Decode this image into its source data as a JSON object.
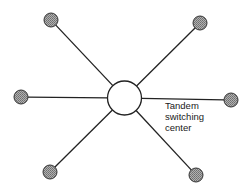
{
  "diagram": {
    "hub": {
      "cx": 124.5,
      "cy": 98,
      "r": 17,
      "fill": "#ffffff",
      "stroke": "#222222",
      "label_lines": [
        "Tandem",
        "switching",
        "center"
      ],
      "label_x": 165,
      "label_y": [
        109,
        120,
        131
      ]
    },
    "nodes": [
      {
        "id": "top-left",
        "cx": 51,
        "cy": 20
      },
      {
        "id": "top-right",
        "cx": 200,
        "cy": 23
      },
      {
        "id": "left",
        "cx": 21,
        "cy": 97
      },
      {
        "id": "right",
        "cx": 231,
        "cy": 100
      },
      {
        "id": "bottom-left",
        "cx": 50,
        "cy": 172
      },
      {
        "id": "bottom-right",
        "cx": 196,
        "cy": 175
      }
    ],
    "node_radius": 7,
    "node_fill": "#9a9a9a",
    "line_color": "#222222"
  }
}
